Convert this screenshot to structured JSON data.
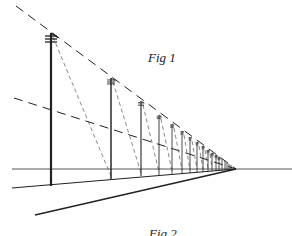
{
  "figure": {
    "caption_top": "Fig 1",
    "caption_bottom": "Fig 2",
    "colors": {
      "ink": "#222222",
      "light_ink": "#555555",
      "background": "#ffffff"
    }
  },
  "drawing": {
    "vanishing_point": [
      236,
      169
    ],
    "horizon": {
      "x1": 12,
      "x2": 292,
      "y": 169
    },
    "ground_lines": [
      {
        "x1": 12,
        "y1": 188
      },
      {
        "x1": 35,
        "y1": 215
      }
    ],
    "dashed_guides": [
      {
        "x1": 16,
        "y1": 6
      },
      {
        "x1": 14,
        "y1": 98
      }
    ],
    "poles": [
      {
        "x": 51,
        "top": 33,
        "bottom": 186
      },
      {
        "x": 111,
        "top": 78,
        "bottom": 179
      },
      {
        "x": 141,
        "top": 101,
        "bottom": 176
      },
      {
        "x": 159,
        "top": 115,
        "bottom": 175
      },
      {
        "x": 172,
        "top": 124,
        "bottom": 174
      },
      {
        "x": 182,
        "top": 131,
        "bottom": 173
      },
      {
        "x": 190,
        "top": 137,
        "bottom": 173
      },
      {
        "x": 197,
        "top": 142,
        "bottom": 172
      },
      {
        "x": 203,
        "top": 146,
        "bottom": 172
      },
      {
        "x": 208,
        "top": 150,
        "bottom": 171
      },
      {
        "x": 212,
        "top": 153,
        "bottom": 171
      },
      {
        "x": 216,
        "top": 155,
        "bottom": 171
      },
      {
        "x": 219,
        "top": 157,
        "bottom": 170
      },
      {
        "x": 222,
        "top": 159,
        "bottom": 170
      },
      {
        "x": 225,
        "top": 161,
        "bottom": 170
      },
      {
        "x": 227,
        "top": 163,
        "bottom": 170
      },
      {
        "x": 229,
        "top": 164,
        "bottom": 170
      },
      {
        "x": 231,
        "top": 165,
        "bottom": 170
      }
    ]
  }
}
